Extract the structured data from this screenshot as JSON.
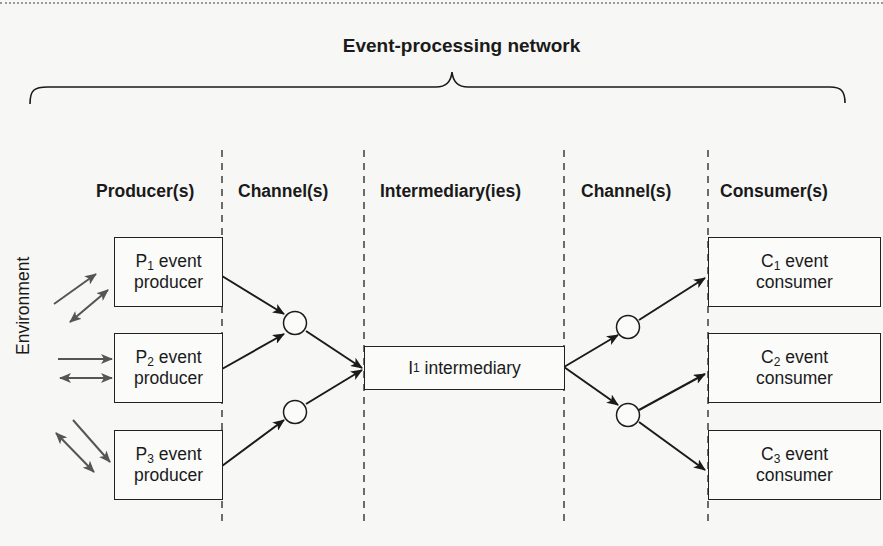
{
  "title": "Event-processing network",
  "columns": [
    {
      "label": "Producer(s)"
    },
    {
      "label": "Channel(s)"
    },
    {
      "label": "Intermediary(ies)"
    },
    {
      "label": "Channel(s)"
    },
    {
      "label": "Consumer(s)"
    }
  ],
  "environment_label": "Environment",
  "producers": [
    {
      "letter": "P",
      "index": "1",
      "line1": "event",
      "line2": "producer"
    },
    {
      "letter": "P",
      "index": "2",
      "line1": "event",
      "line2": "producer"
    },
    {
      "letter": "P",
      "index": "3",
      "line1": "event",
      "line2": "producer"
    }
  ],
  "intermediary": {
    "letter": "I",
    "index": "1",
    "text": "intermediary"
  },
  "consumers": [
    {
      "letter": "C",
      "index": "1",
      "line1": "event",
      "line2": "consumer"
    },
    {
      "letter": "C",
      "index": "2",
      "line1": "event",
      "line2": "consumer"
    },
    {
      "letter": "C",
      "index": "3",
      "line1": "event",
      "line2": "consumer"
    }
  ],
  "colors": {
    "line": "#1a1a1a",
    "env_arrow": "#555555",
    "background": "#f7f7f5"
  }
}
